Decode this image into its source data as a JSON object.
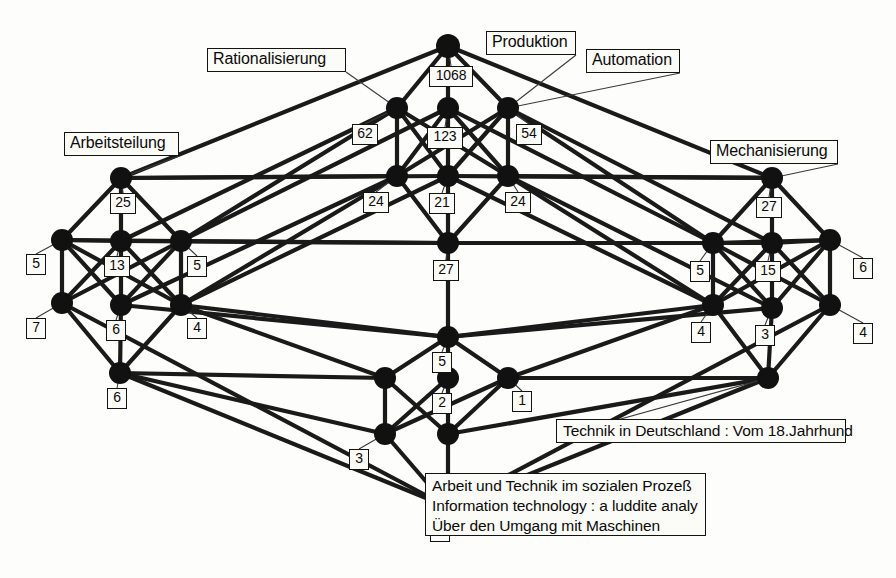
{
  "diagram": {
    "type": "concept-lattice",
    "background_color": "#fdfdfb",
    "node_color": "#111111",
    "edge_color": "#1a1a1a",
    "label_border_color": "#15130f"
  },
  "attribute_labels": [
    {
      "id": "rationalisierung",
      "text": "Rationalisierung",
      "x": 207,
      "y": 48,
      "w": 139,
      "h": 24,
      "anchor_x": 397,
      "anchor_y": 108
    },
    {
      "id": "produktion",
      "text": "Produktion",
      "x": 486,
      "y": 31,
      "w": 90,
      "h": 24,
      "anchor_x": 508,
      "anchor_y": 108
    },
    {
      "id": "automation",
      "text": "Automation",
      "x": 586,
      "y": 49,
      "w": 94,
      "h": 24,
      "anchor_x": 508,
      "anchor_y": 108
    },
    {
      "id": "arbeitsteilung",
      "text": "Arbeitsteilung",
      "x": 64,
      "y": 132,
      "w": 115,
      "h": 24,
      "anchor_x": 121,
      "anchor_y": 178
    },
    {
      "id": "mechanisierung",
      "text": "Mechanisierung",
      "x": 710,
      "y": 140,
      "w": 128,
      "h": 24,
      "anchor_x": 772,
      "anchor_y": 178
    }
  ],
  "object_labels": [
    {
      "id": "technik-deutschland",
      "lines": [
        "Technik in Deutschland : Vom 18.Jahrhund"
      ],
      "x": 556,
      "y": 419,
      "w": 290,
      "h": 24,
      "anchor_x": 768,
      "anchor_y": 378
    },
    {
      "id": "bottom-objects",
      "lines": [
        "Arbeit und Technik im sozialen Prozeß",
        "Information technology : a luddite analy",
        "Über den Umgang mit Maschinen"
      ],
      "x": 425,
      "y": 473,
      "w": 281,
      "h": 63,
      "anchor_x": 448,
      "anchor_y": 507
    }
  ],
  "count_labels": [
    {
      "id": "c-1068",
      "value": "1068",
      "x": 429,
      "y": 66,
      "w": 44,
      "h": 21,
      "node_x": 448,
      "node_y": 46
    },
    {
      "id": "c-62",
      "value": "62",
      "x": 352,
      "y": 124,
      "w": 26,
      "h": 21,
      "node_x": 397,
      "node_y": 108
    },
    {
      "id": "c-123",
      "value": "123",
      "x": 427,
      "y": 127,
      "w": 36,
      "h": 22,
      "node_x": 448,
      "node_y": 108
    },
    {
      "id": "c-54",
      "value": "54",
      "x": 516,
      "y": 124,
      "w": 26,
      "h": 21,
      "node_x": 508,
      "node_y": 108
    },
    {
      "id": "c-25",
      "value": "25",
      "x": 110,
      "y": 193,
      "w": 26,
      "h": 21,
      "node_x": 121,
      "node_y": 178
    },
    {
      "id": "c-24L",
      "value": "24",
      "x": 363,
      "y": 192,
      "w": 26,
      "h": 21,
      "node_x": 397,
      "node_y": 176
    },
    {
      "id": "c-21",
      "value": "21",
      "x": 429,
      "y": 193,
      "w": 26,
      "h": 21,
      "node_x": 448,
      "node_y": 176
    },
    {
      "id": "c-24R",
      "value": "24",
      "x": 505,
      "y": 192,
      "w": 26,
      "h": 21,
      "node_x": 508,
      "node_y": 176
    },
    {
      "id": "c-27R",
      "value": "27",
      "x": 756,
      "y": 197,
      "w": 26,
      "h": 21,
      "node_x": 772,
      "node_y": 178
    },
    {
      "id": "c-5L",
      "value": "5",
      "x": 26,
      "y": 254,
      "w": 20,
      "h": 21,
      "node_x": 62,
      "node_y": 240
    },
    {
      "id": "c-13",
      "value": "13",
      "x": 104,
      "y": 256,
      "w": 26,
      "h": 21,
      "node_x": 121,
      "node_y": 241
    },
    {
      "id": "c-5M",
      "value": "5",
      "x": 187,
      "y": 256,
      "w": 20,
      "h": 21,
      "node_x": 181,
      "node_y": 241
    },
    {
      "id": "c-27C",
      "value": "27",
      "x": 433,
      "y": 260,
      "w": 26,
      "h": 21,
      "node_x": 448,
      "node_y": 243
    },
    {
      "id": "c-5RL",
      "value": "5",
      "x": 690,
      "y": 261,
      "w": 20,
      "h": 21,
      "node_x": 713,
      "node_y": 243
    },
    {
      "id": "c-15",
      "value": "15",
      "x": 755,
      "y": 261,
      "w": 26,
      "h": 21,
      "node_x": 772,
      "node_y": 243
    },
    {
      "id": "c-6R",
      "value": "6",
      "x": 853,
      "y": 258,
      "w": 20,
      "h": 21,
      "node_x": 830,
      "node_y": 240
    },
    {
      "id": "c-7L",
      "value": "7",
      "x": 26,
      "y": 318,
      "w": 20,
      "h": 21,
      "node_x": 62,
      "node_y": 303
    },
    {
      "id": "c-6LM",
      "value": "6",
      "x": 106,
      "y": 320,
      "w": 20,
      "h": 21,
      "node_x": 121,
      "node_y": 305
    },
    {
      "id": "c-4LM",
      "value": "4",
      "x": 187,
      "y": 318,
      "w": 20,
      "h": 21,
      "node_x": 181,
      "node_y": 305
    },
    {
      "id": "c-4RL",
      "value": "4",
      "x": 691,
      "y": 322,
      "w": 20,
      "h": 21,
      "node_x": 713,
      "node_y": 305
    },
    {
      "id": "c-3R",
      "value": "3",
      "x": 755,
      "y": 325,
      "w": 20,
      "h": 21,
      "node_x": 772,
      "node_y": 308
    },
    {
      "id": "c-4RR",
      "value": "4",
      "x": 853,
      "y": 323,
      "w": 20,
      "h": 21,
      "node_x": 830,
      "node_y": 305
    },
    {
      "id": "c-5C",
      "value": "5",
      "x": 432,
      "y": 352,
      "w": 20,
      "h": 21,
      "node_x": 448,
      "node_y": 337
    },
    {
      "id": "c-6LB",
      "value": "6",
      "x": 107,
      "y": 388,
      "w": 20,
      "h": 21,
      "node_x": 120,
      "node_y": 373
    },
    {
      "id": "c-2C",
      "value": "2",
      "x": 432,
      "y": 393,
      "w": 20,
      "h": 21,
      "node_x": 448,
      "node_y": 378
    },
    {
      "id": "c-1C",
      "value": "1",
      "x": 512,
      "y": 391,
      "w": 20,
      "h": 21,
      "node_x": 508,
      "node_y": 378
    },
    {
      "id": "c-3C",
      "value": "3",
      "x": 349,
      "y": 449,
      "w": 20,
      "h": 21,
      "node_x": 385,
      "node_y": 434
    },
    {
      "id": "c-1B",
      "value": "1",
      "x": 430,
      "y": 521,
      "w": 20,
      "h": 21,
      "node_x": 448,
      "node_y": 507
    }
  ],
  "nodes": [
    {
      "id": "n-top",
      "x": 448,
      "y": 46,
      "r": 12
    },
    {
      "id": "n-u1",
      "x": 397,
      "y": 108,
      "r": 11
    },
    {
      "id": "n-u2",
      "x": 448,
      "y": 108,
      "r": 11
    },
    {
      "id": "n-u3",
      "x": 508,
      "y": 108,
      "r": 11
    },
    {
      "id": "n-al",
      "x": 121,
      "y": 178,
      "r": 11
    },
    {
      "id": "n-m1",
      "x": 397,
      "y": 176,
      "r": 11
    },
    {
      "id": "n-m2",
      "x": 448,
      "y": 176,
      "r": 11
    },
    {
      "id": "n-m3",
      "x": 508,
      "y": 176,
      "r": 11
    },
    {
      "id": "n-mr",
      "x": 772,
      "y": 178,
      "r": 11
    },
    {
      "id": "n-L0",
      "x": 62,
      "y": 240,
      "r": 11
    },
    {
      "id": "n-L1",
      "x": 121,
      "y": 241,
      "r": 11
    },
    {
      "id": "n-L2",
      "x": 181,
      "y": 241,
      "r": 11
    },
    {
      "id": "n-cmid",
      "x": 448,
      "y": 243,
      "r": 11
    },
    {
      "id": "n-R1",
      "x": 713,
      "y": 243,
      "r": 11
    },
    {
      "id": "n-R2",
      "x": 772,
      "y": 243,
      "r": 11
    },
    {
      "id": "n-R0",
      "x": 830,
      "y": 240,
      "r": 11
    },
    {
      "id": "n-L0b",
      "x": 62,
      "y": 303,
      "r": 11
    },
    {
      "id": "n-L1b",
      "x": 121,
      "y": 305,
      "r": 11
    },
    {
      "id": "n-L2b",
      "x": 181,
      "y": 305,
      "r": 11
    },
    {
      "id": "n-R1b",
      "x": 713,
      "y": 305,
      "r": 11
    },
    {
      "id": "n-R2b",
      "x": 772,
      "y": 308,
      "r": 11
    },
    {
      "id": "n-R0b",
      "x": 830,
      "y": 305,
      "r": 11
    },
    {
      "id": "n-clow",
      "x": 448,
      "y": 337,
      "r": 11
    },
    {
      "id": "n-Lbot",
      "x": 120,
      "y": 373,
      "r": 11
    },
    {
      "id": "n-cb1",
      "x": 385,
      "y": 378,
      "r": 11
    },
    {
      "id": "n-cb2",
      "x": 448,
      "y": 378,
      "r": 11
    },
    {
      "id": "n-cb3",
      "x": 508,
      "y": 378,
      "r": 11
    },
    {
      "id": "n-Rbot",
      "x": 768,
      "y": 378,
      "r": 11
    },
    {
      "id": "n-d1",
      "x": 385,
      "y": 434,
      "r": 11
    },
    {
      "id": "n-d2",
      "x": 448,
      "y": 434,
      "r": 11
    },
    {
      "id": "n-bot",
      "x": 448,
      "y": 507,
      "r": 11
    }
  ],
  "edges": [
    [
      "n-top",
      "n-u1"
    ],
    [
      "n-top",
      "n-u2"
    ],
    [
      "n-top",
      "n-u3"
    ],
    [
      "n-top",
      "n-al"
    ],
    [
      "n-top",
      "n-mr"
    ],
    [
      "n-u1",
      "n-m1"
    ],
    [
      "n-u1",
      "n-m2"
    ],
    [
      "n-u1",
      "n-m3"
    ],
    [
      "n-u2",
      "n-m1"
    ],
    [
      "n-u2",
      "n-m2"
    ],
    [
      "n-u2",
      "n-m3"
    ],
    [
      "n-u3",
      "n-m1"
    ],
    [
      "n-u3",
      "n-m2"
    ],
    [
      "n-u3",
      "n-m3"
    ],
    [
      "n-u1",
      "n-L1"
    ],
    [
      "n-u1",
      "n-L2"
    ],
    [
      "n-u2",
      "n-L2"
    ],
    [
      "n-u3",
      "n-R1"
    ],
    [
      "n-u3",
      "n-R2"
    ],
    [
      "n-u2",
      "n-R1"
    ],
    [
      "n-al",
      "n-L0"
    ],
    [
      "n-al",
      "n-L1"
    ],
    [
      "n-al",
      "n-L2"
    ],
    [
      "n-al",
      "n-m1"
    ],
    [
      "n-al",
      "n-m2"
    ],
    [
      "n-mr",
      "n-R0"
    ],
    [
      "n-mr",
      "n-R1"
    ],
    [
      "n-mr",
      "n-R2"
    ],
    [
      "n-mr",
      "n-m2"
    ],
    [
      "n-mr",
      "n-m3"
    ],
    [
      "n-m1",
      "n-cmid"
    ],
    [
      "n-m2",
      "n-cmid"
    ],
    [
      "n-m3",
      "n-cmid"
    ],
    [
      "n-m1",
      "n-L1b"
    ],
    [
      "n-m1",
      "n-L2b"
    ],
    [
      "n-m3",
      "n-R1b"
    ],
    [
      "n-m3",
      "n-R2b"
    ],
    [
      "n-m2",
      "n-L2b"
    ],
    [
      "n-m2",
      "n-R1b"
    ],
    [
      "n-L0",
      "n-L1"
    ],
    [
      "n-L0",
      "n-L2"
    ],
    [
      "n-L0",
      "n-L0b"
    ],
    [
      "n-L0",
      "n-L1b"
    ],
    [
      "n-L0",
      "n-L2b"
    ],
    [
      "n-L1",
      "n-L0b"
    ],
    [
      "n-L1",
      "n-L1b"
    ],
    [
      "n-L1",
      "n-L2b"
    ],
    [
      "n-L2",
      "n-L0b"
    ],
    [
      "n-L2",
      "n-L1b"
    ],
    [
      "n-L2",
      "n-L2b"
    ],
    [
      "n-R0",
      "n-R1"
    ],
    [
      "n-R0",
      "n-R2"
    ],
    [
      "n-R0",
      "n-R0b"
    ],
    [
      "n-R0",
      "n-R1b"
    ],
    [
      "n-R0",
      "n-R2b"
    ],
    [
      "n-R1",
      "n-R0b"
    ],
    [
      "n-R1",
      "n-R1b"
    ],
    [
      "n-R1",
      "n-R2b"
    ],
    [
      "n-R2",
      "n-R0b"
    ],
    [
      "n-R2",
      "n-R1b"
    ],
    [
      "n-R2",
      "n-R2b"
    ],
    [
      "n-L1",
      "n-cmid"
    ],
    [
      "n-L2",
      "n-cmid"
    ],
    [
      "n-R1",
      "n-cmid"
    ],
    [
      "n-R2",
      "n-cmid"
    ],
    [
      "n-cmid",
      "n-clow"
    ],
    [
      "n-L1b",
      "n-clow"
    ],
    [
      "n-L2b",
      "n-clow"
    ],
    [
      "n-R1b",
      "n-clow"
    ],
    [
      "n-R2b",
      "n-clow"
    ],
    [
      "n-L0b",
      "n-Lbot"
    ],
    [
      "n-L1b",
      "n-Lbot"
    ],
    [
      "n-L2b",
      "n-Lbot"
    ],
    [
      "n-R0b",
      "n-Rbot"
    ],
    [
      "n-R1b",
      "n-Rbot"
    ],
    [
      "n-R2b",
      "n-Rbot"
    ],
    [
      "n-clow",
      "n-cb1"
    ],
    [
      "n-clow",
      "n-cb2"
    ],
    [
      "n-clow",
      "n-cb3"
    ],
    [
      "n-L2b",
      "n-cb1"
    ],
    [
      "n-R1b",
      "n-cb3"
    ],
    [
      "n-cb1",
      "n-d1"
    ],
    [
      "n-cb1",
      "n-d2"
    ],
    [
      "n-cb2",
      "n-d1"
    ],
    [
      "n-cb2",
      "n-d2"
    ],
    [
      "n-cb3",
      "n-d1"
    ],
    [
      "n-cb3",
      "n-d2"
    ],
    [
      "n-Lbot",
      "n-d1"
    ],
    [
      "n-Lbot",
      "n-cb1"
    ],
    [
      "n-Rbot",
      "n-d2"
    ],
    [
      "n-Rbot",
      "n-cb3"
    ],
    [
      "n-d1",
      "n-bot"
    ],
    [
      "n-d2",
      "n-bot"
    ],
    [
      "n-Lbot",
      "n-bot"
    ],
    [
      "n-Rbot",
      "n-bot"
    ],
    [
      "n-L0b",
      "n-bot"
    ],
    [
      "n-R0b",
      "n-bot"
    ]
  ]
}
